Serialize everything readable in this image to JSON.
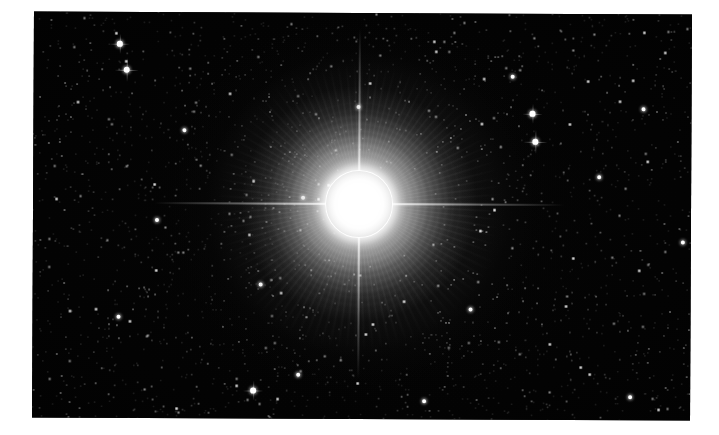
{
  "page": {
    "kind": "astronomical-photograph",
    "canvas_width": 719,
    "canvas_height": 435,
    "background_color": "#ffffff",
    "caption": ""
  },
  "photo": {
    "name": "bright-star-field",
    "left": 33,
    "top": 13,
    "width": 658,
    "height": 406,
    "rotation_deg": 0.28,
    "sky_color": "#000000",
    "description": "Deep-sky photograph of an overexposed bright star surrounded by a dense field of faint stars"
  },
  "main_star": {
    "name": "central-bright-star",
    "center_x": 365,
    "center_y": 211,
    "core_radius_px": 34,
    "halo_radius_px": 130,
    "core_color": "#ffffff",
    "halo_color": "#c8c8c8",
    "spike_color": "#ffffff",
    "spike_horizontal_length_px": 410,
    "spike_vertical_length_px": 350,
    "saturated": "true"
  },
  "starfield": {
    "dot_color": "#ffffff",
    "dim_dot_color": "#9a9a9a",
    "approx_count": 2600,
    "seed": 20240617
  },
  "bright_field_stars": [
    {
      "x": 86,
      "y": 32,
      "r": 2.6
    },
    {
      "x": 93,
      "y": 58,
      "r": 3.0
    },
    {
      "x": 499,
      "y": 100,
      "r": 2.6
    },
    {
      "x": 502,
      "y": 128,
      "r": 2.9
    },
    {
      "x": 610,
      "y": 95,
      "r": 2.3
    },
    {
      "x": 270,
      "y": 185,
      "r": 2.2
    },
    {
      "x": 228,
      "y": 272,
      "r": 2.2
    },
    {
      "x": 438,
      "y": 296,
      "r": 2.2
    },
    {
      "x": 86,
      "y": 305,
      "r": 2.4
    },
    {
      "x": 221,
      "y": 378,
      "r": 2.6
    },
    {
      "x": 266,
      "y": 362,
      "r": 2.2
    },
    {
      "x": 566,
      "y": 163,
      "r": 2.2
    },
    {
      "x": 479,
      "y": 63,
      "r": 2.1
    },
    {
      "x": 151,
      "y": 118,
      "r": 2.0
    },
    {
      "x": 325,
      "y": 94,
      "r": 2.0
    },
    {
      "x": 650,
      "y": 228,
      "r": 2.1
    },
    {
      "x": 598,
      "y": 383,
      "r": 2.0
    },
    {
      "x": 392,
      "y": 388,
      "r": 2.0
    },
    {
      "x": 124,
      "y": 208,
      "r": 2.0
    },
    {
      "x": 668,
      "y": 310,
      "r": 2.0
    }
  ]
}
